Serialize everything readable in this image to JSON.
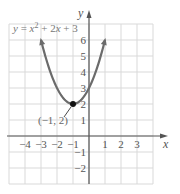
{
  "chart_data": {
    "type": "line",
    "equation": {
      "prefix": "y = ",
      "var": "x",
      "exp": "2",
      "suffix": " + 2",
      "var2": "x",
      "tail": " + 3"
    },
    "xlabel": "x",
    "ylabel": "y",
    "xlim": [
      -5,
      4
    ],
    "ylim": [
      -3,
      7
    ],
    "grid": true,
    "x_ticks": [
      {
        "value": -4,
        "label": "−4"
      },
      {
        "value": -3,
        "label": "−3"
      },
      {
        "value": -2,
        "label": "−2"
      },
      {
        "value": -1,
        "label": "−1"
      },
      {
        "value": 1,
        "label": "1"
      },
      {
        "value": 2,
        "label": "2"
      },
      {
        "value": 3,
        "label": "3"
      }
    ],
    "y_ticks": [
      {
        "value": -2,
        "label": "−2"
      },
      {
        "value": -1,
        "label": "−1"
      },
      {
        "value": 1,
        "label": "1"
      },
      {
        "value": 2,
        "label": "2"
      },
      {
        "value": 3,
        "label": "3"
      },
      {
        "value": 4,
        "label": "4"
      },
      {
        "value": 5,
        "label": "5"
      },
      {
        "value": 6,
        "label": "6"
      }
    ],
    "series": [
      {
        "name": "y = x^2 + 2x + 3",
        "x": [
          -3,
          -2.5,
          -2,
          -1.5,
          -1,
          -0.5,
          0,
          0.5,
          1
        ],
        "y": [
          6,
          4.25,
          3,
          2.25,
          2,
          2.25,
          3,
          4.25,
          6
        ],
        "arrows_at_ends": true
      }
    ],
    "annotations": [
      {
        "type": "point",
        "x": -1,
        "y": 2,
        "label": "(−1, 2)"
      }
    ],
    "colors": {
      "curve": "#6b6b6b",
      "grid": "#d9d9d9",
      "axis": "#555555",
      "point": "#111111"
    }
  }
}
